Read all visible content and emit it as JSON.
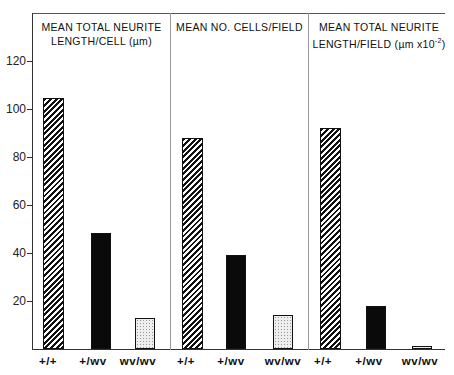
{
  "chart_data": {
    "type": "bar",
    "layout": "three side-by-side panels sharing a y-axis",
    "y_ticks": [
      20,
      40,
      60,
      80,
      100,
      120
    ],
    "ylim": [
      0,
      128
    ],
    "grid": false,
    "legend": null,
    "categories": [
      "+/+",
      "+/wv",
      "wv/wv"
    ],
    "fills": {
      "+/+": "diagonal-hatch",
      "+/wv": "solid-black",
      "wv/wv": "stippled-light"
    },
    "panels": [
      {
        "title_line1": "MEAN TOTAL NEURITE",
        "title_line2": "LENGTH/CELL (µm)",
        "values": [
          104.5,
          48.5,
          13
        ]
      },
      {
        "title_line1": "MEAN NO. CELLS/FIELD",
        "title_line2": "",
        "values": [
          88,
          39,
          14
        ]
      },
      {
        "title_line1": "MEAN TOTAL NEURITE",
        "title_line2": "LENGTH/FIELD (µm x10",
        "title_line2_sup": "-2",
        "title_line2_end": ")",
        "values": [
          92,
          18,
          1
        ]
      }
    ]
  }
}
